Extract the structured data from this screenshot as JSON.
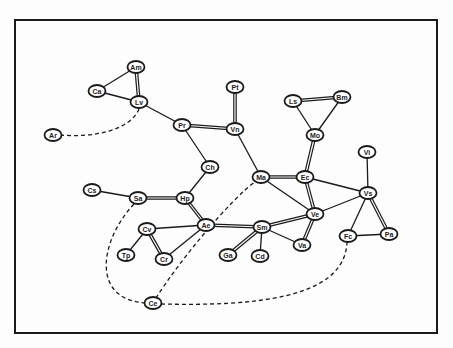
{
  "diagram": {
    "type": "network-graph",
    "frame": {
      "x": 15,
      "y": 19,
      "width": 422,
      "height": 314
    },
    "nodes": [
      {
        "id": "Am",
        "label": "Am",
        "x": 136,
        "y": 67
      },
      {
        "id": "Ca",
        "label": "Ca",
        "x": 97,
        "y": 91
      },
      {
        "id": "Lv",
        "label": "Lv",
        "x": 139,
        "y": 102
      },
      {
        "id": "Ar",
        "label": "Ar",
        "x": 53,
        "y": 135
      },
      {
        "id": "Pr",
        "label": "Pr",
        "x": 182,
        "y": 125
      },
      {
        "id": "Vn",
        "label": "Vn",
        "x": 235,
        "y": 129
      },
      {
        "id": "Pt",
        "label": "Pt",
        "x": 235,
        "y": 87
      },
      {
        "id": "Ch",
        "label": "Ch",
        "x": 210,
        "y": 167
      },
      {
        "id": "Ls",
        "label": "Ls",
        "x": 293,
        "y": 101
      },
      {
        "id": "Bm",
        "label": "Bm",
        "x": 342,
        "y": 97
      },
      {
        "id": "Mo",
        "label": "Mo",
        "x": 315,
        "y": 135
      },
      {
        "id": "Vi",
        "label": "Vi",
        "x": 367,
        "y": 152
      },
      {
        "id": "Ma",
        "label": "Ma",
        "x": 261,
        "y": 177
      },
      {
        "id": "Ec",
        "label": "Ec",
        "x": 305,
        "y": 177
      },
      {
        "id": "Vs",
        "label": "Vs",
        "x": 368,
        "y": 193
      },
      {
        "id": "Ve",
        "label": "Ve",
        "x": 315,
        "y": 214
      },
      {
        "id": "Fc",
        "label": "Fc",
        "x": 348,
        "y": 236
      },
      {
        "id": "Pa",
        "label": "Pa",
        "x": 389,
        "y": 234
      },
      {
        "id": "Sm",
        "label": "Sm",
        "x": 262,
        "y": 227
      },
      {
        "id": "Va",
        "label": "Va",
        "x": 302,
        "y": 245
      },
      {
        "id": "Ga",
        "label": "Ga",
        "x": 228,
        "y": 255
      },
      {
        "id": "Cd",
        "label": "Cd",
        "x": 260,
        "y": 256
      },
      {
        "id": "Ae",
        "label": "Ae",
        "x": 206,
        "y": 225
      },
      {
        "id": "Cs",
        "label": "Cs",
        "x": 92,
        "y": 190
      },
      {
        "id": "Sa",
        "label": "Sa",
        "x": 138,
        "y": 198
      },
      {
        "id": "Hp",
        "label": "Hp",
        "x": 185,
        "y": 198
      },
      {
        "id": "Cv",
        "label": "Cv",
        "x": 147,
        "y": 229
      },
      {
        "id": "Cr",
        "label": "Cr",
        "x": 164,
        "y": 259
      },
      {
        "id": "Tp",
        "label": "Tp",
        "x": 126,
        "y": 255
      },
      {
        "id": "Ce",
        "label": "Ce",
        "x": 153,
        "y": 303
      }
    ],
    "edges": [
      {
        "from": "Am",
        "to": "Ca",
        "style": "single"
      },
      {
        "from": "Am",
        "to": "Lv",
        "style": "double"
      },
      {
        "from": "Ca",
        "to": "Lv",
        "style": "single"
      },
      {
        "from": "Lv",
        "to": "Pr",
        "style": "single"
      },
      {
        "from": "Pr",
        "to": "Vn",
        "style": "double"
      },
      {
        "from": "Pt",
        "to": "Vn",
        "style": "double"
      },
      {
        "from": "Pr",
        "to": "Ch",
        "style": "single"
      },
      {
        "from": "Vn",
        "to": "Ma",
        "style": "single"
      },
      {
        "from": "Ch",
        "to": "Hp",
        "style": "single"
      },
      {
        "from": "Ls",
        "to": "Bm",
        "style": "double"
      },
      {
        "from": "Ls",
        "to": "Mo",
        "style": "single"
      },
      {
        "from": "Bm",
        "to": "Mo",
        "style": "single"
      },
      {
        "from": "Mo",
        "to": "Ec",
        "style": "double"
      },
      {
        "from": "Ma",
        "to": "Ec",
        "style": "double"
      },
      {
        "from": "Ma",
        "to": "Ve",
        "style": "single"
      },
      {
        "from": "Ec",
        "to": "Ve",
        "style": "double"
      },
      {
        "from": "Ec",
        "to": "Vs",
        "style": "single"
      },
      {
        "from": "Vi",
        "to": "Vs",
        "style": "single"
      },
      {
        "from": "Ve",
        "to": "Vs",
        "style": "single"
      },
      {
        "from": "Vs",
        "to": "Fc",
        "style": "single"
      },
      {
        "from": "Vs",
        "to": "Pa",
        "style": "double"
      },
      {
        "from": "Fc",
        "to": "Pa",
        "style": "single"
      },
      {
        "from": "Ve",
        "to": "Sm",
        "style": "double"
      },
      {
        "from": "Ve",
        "to": "Va",
        "style": "double"
      },
      {
        "from": "Sm",
        "to": "Va",
        "style": "single"
      },
      {
        "from": "Sm",
        "to": "Ga",
        "style": "double"
      },
      {
        "from": "Sm",
        "to": "Cd",
        "style": "single"
      },
      {
        "from": "Ae",
        "to": "Sm",
        "style": "double"
      },
      {
        "from": "Hp",
        "to": "Ae",
        "style": "double"
      },
      {
        "from": "Sa",
        "to": "Hp",
        "style": "double"
      },
      {
        "from": "Cs",
        "to": "Sa",
        "style": "single"
      },
      {
        "from": "Cv",
        "to": "Ae",
        "style": "single"
      },
      {
        "from": "Cv",
        "to": "Cr",
        "style": "double"
      },
      {
        "from": "Cv",
        "to": "Tp",
        "style": "single"
      },
      {
        "from": "Cr",
        "to": "Ae",
        "style": "single"
      }
    ],
    "dashed_edges": [
      {
        "from": "Ar",
        "to": "Lv",
        "path": "M60,135 C95,138 130,130 139,109"
      },
      {
        "from": "Sa",
        "to": "Ce",
        "path": "M134,204 C100,240 90,300 146,303"
      },
      {
        "from": "Ce",
        "to": "Ma",
        "path": "M156,298 C180,260 230,200 256,181"
      },
      {
        "from": "Ce",
        "to": "Fc",
        "path": "M161,304 C250,306 345,300 347,242"
      }
    ]
  }
}
